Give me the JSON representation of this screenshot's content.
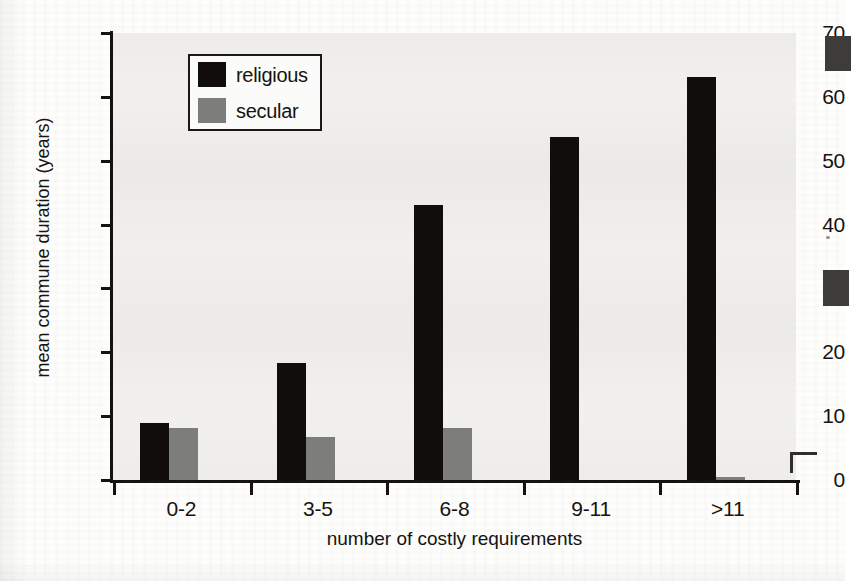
{
  "chart_data": {
    "type": "bar",
    "title": "",
    "xlabel": "number of costly requirements",
    "ylabel": "mean commune duration (years)",
    "categories": [
      "0-2",
      "3-5",
      "6-8",
      "9-11",
      ">11"
    ],
    "series": [
      {
        "name": "religious",
        "color": "#100d0b",
        "values": [
          9.0,
          18.4,
          43.0,
          53.7,
          63.1
        ]
      },
      {
        "name": "secular",
        "color": "#7d7d7b",
        "values": [
          8.1,
          6.7,
          8.1,
          0.0,
          0.5
        ]
      }
    ],
    "ylim": [
      0,
      70
    ],
    "yticks": [
      0,
      10,
      20,
      30,
      40,
      50,
      60,
      70
    ],
    "ytick_labels": [
      "0",
      "10",
      "20",
      "30",
      "40",
      "50",
      "60",
      "70"
    ],
    "grid": false,
    "legend_position": "upper left",
    "legend_entries": [
      "religious",
      "secular"
    ]
  },
  "legend": {
    "items": [
      {
        "label": "religious",
        "swatch": "religious-swatch"
      },
      {
        "label": "secular",
        "swatch": "secular-swatch"
      }
    ]
  },
  "axes": {
    "y_title": "mean commune duration (years)",
    "x_title": "number of costly requirements"
  }
}
